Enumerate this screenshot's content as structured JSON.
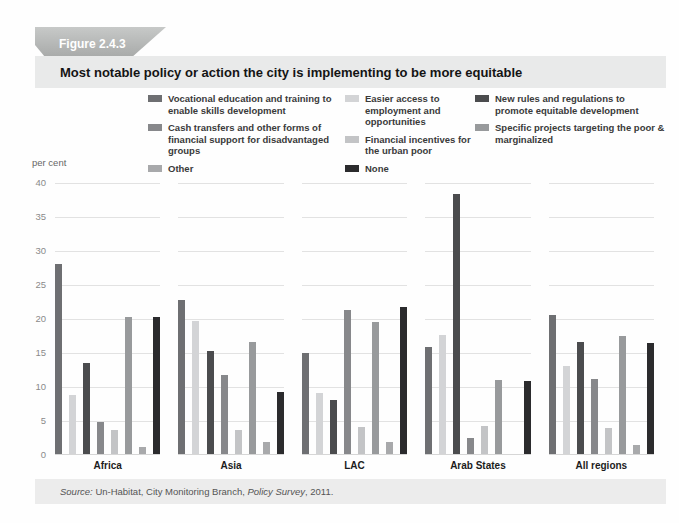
{
  "figure": {
    "label": "Figure 2.4.3",
    "title": "Most notable policy or action the city is implementing to be more equitable"
  },
  "source_note": {
    "parts": [
      {
        "text": "Source:",
        "italic": true
      },
      {
        "text": " Un-Habitat, City Monitoring Branch, ",
        "italic": false
      },
      {
        "text": "Policy Survey",
        "italic": true
      },
      {
        "text": ", 2011.",
        "italic": false
      }
    ]
  },
  "chart_data": {
    "type": "bar",
    "title": "Most notable policy or action the city is implementing to be more equitable",
    "xlabel": "",
    "ylabel": "per cent",
    "ylim": [
      0,
      40
    ],
    "yticks": [
      0,
      5,
      10,
      15,
      20,
      25,
      30,
      35,
      40
    ],
    "grid": "horizontal",
    "legend_position": "top",
    "categories": [
      "Africa",
      "Asia",
      "LAC",
      "Arab States",
      "All regions"
    ],
    "series": [
      {
        "name": "Vocational education and training to enable skills development",
        "color": "#6e6f72",
        "values": [
          28.0,
          22.6,
          14.9,
          15.8,
          20.4
        ]
      },
      {
        "name": "Easier access to employment and opportunities",
        "color": "#d3d4d6",
        "values": [
          8.7,
          19.5,
          8.9,
          17.5,
          12.9
        ]
      },
      {
        "name": "New rules and regulations to promote equitable development",
        "color": "#4b4c4e",
        "values": [
          13.4,
          15.2,
          8.0,
          38.3,
          16.4
        ]
      },
      {
        "name": "Cash transfers and other forms of financial support for disadvantaged groups",
        "color": "#87888b",
        "values": [
          4.7,
          11.6,
          21.2,
          2.4,
          11.1
        ]
      },
      {
        "name": "Financial incentives for the urban poor",
        "color": "#c3c4c6",
        "values": [
          3.6,
          3.6,
          4.0,
          4.1,
          3.8
        ]
      },
      {
        "name": "Specific projects targeting the poor & marginalized",
        "color": "#989a9c",
        "values": [
          20.2,
          16.4,
          19.4,
          10.9,
          17.4
        ]
      },
      {
        "name": "Other",
        "color": "#a8a9ab",
        "values": [
          1.0,
          1.8,
          1.7,
          0,
          1.3
        ]
      },
      {
        "name": "None",
        "color": "#2b2b2d",
        "values": [
          20.2,
          9.1,
          21.6,
          10.8,
          16.3
        ]
      }
    ]
  }
}
